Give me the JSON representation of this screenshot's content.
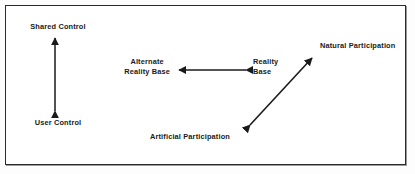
{
  "figure": {
    "type": "relationship-diagram",
    "border_color": "#2b2b2b",
    "background_color": "#ffffff",
    "text_color": "#1a1a1a",
    "arrow_color": "#1a1a1a"
  },
  "nodes": [
    {
      "id": "shared-control",
      "label": "Shared Control",
      "lines": [
        "Shared Control"
      ],
      "x": 58,
      "y": 22,
      "align": "centered"
    },
    {
      "id": "user-control",
      "label": "User Control",
      "lines": [
        "User Control"
      ],
      "x": 58,
      "y": 118,
      "align": "centered"
    },
    {
      "id": "alternate-reality-base",
      "label": "Alternate Reality Base",
      "lines": [
        "Alternate",
        "Reality Base"
      ],
      "x": 170,
      "y": 57,
      "align": "right-aligned"
    },
    {
      "id": "reality-base",
      "label": "Reality Base",
      "lines": [
        "Reality",
        "Base"
      ],
      "x": 253,
      "y": 57,
      "align": "left-aligned"
    },
    {
      "id": "natural-participation",
      "label": "Natural Participation",
      "lines": [
        "Natural Participation"
      ],
      "x": 320,
      "y": 41,
      "align": "left-aligned"
    },
    {
      "id": "artificial-participation",
      "label": "Artificial Participation",
      "lines": [
        "Artificial Participation"
      ],
      "x": 150,
      "y": 132,
      "align": "left-aligned"
    }
  ],
  "connectors": [
    {
      "id": "control-axis",
      "orientation": "vertical",
      "double_headed": true,
      "from_node": "user-control",
      "to_node": "shared-control",
      "x1": 55,
      "y1": 113,
      "x2": 55,
      "y2": 36
    },
    {
      "id": "reality-axis",
      "orientation": "horizontal",
      "double_headed": true,
      "from_node": "reality-base",
      "to_node": "alternate-reality-base",
      "x1": 248,
      "y1": 70,
      "x2": 177,
      "y2": 70
    },
    {
      "id": "participation-axis",
      "orientation": "diagonal",
      "double_headed": true,
      "from_node": "artificial-participation",
      "to_node": "natural-participation",
      "x1": 248,
      "y1": 127,
      "x2": 314,
      "y2": 56
    }
  ]
}
